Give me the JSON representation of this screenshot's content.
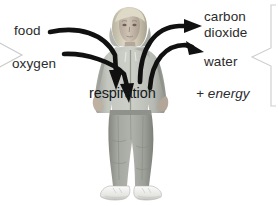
{
  "diagram": {
    "center_label": "respiration",
    "inputs": [
      {
        "id": "food",
        "label": "food"
      },
      {
        "id": "oxygen",
        "label": "oxygen"
      }
    ],
    "outputs": [
      {
        "id": "carbon-dioxide-line-1",
        "label": "carbon"
      },
      {
        "id": "carbon-dioxide-line-2",
        "label": "dioxide"
      },
      {
        "id": "water",
        "label": "water"
      },
      {
        "id": "energy",
        "label": "+ energy",
        "style": "italic"
      }
    ],
    "icons": {
      "input_arrow_food": "curved-arrow-down-right-icon",
      "input_arrow_oxygen": "curved-arrow-down-right-icon",
      "output_arrow_co2": "curved-arrow-up-right-icon",
      "output_arrow_water": "curved-arrow-up-right-icon",
      "bracket_left": "bracket-pointer-right-icon",
      "bracket_right": "bracket-pointer-left-icon",
      "subject": "standing-person-photo-icon"
    },
    "colors": {
      "background": "#ffffff",
      "text": "#2b2b2b",
      "center_text": "#15181d",
      "arrow": "#111111",
      "bracket": "#c9c9c9",
      "hoodie": "#b8bcb4",
      "jeans": "#9a9b97",
      "hair": "#d6cfbd",
      "skin": "#c9bcae",
      "shoes": "#f2f2f0"
    }
  }
}
